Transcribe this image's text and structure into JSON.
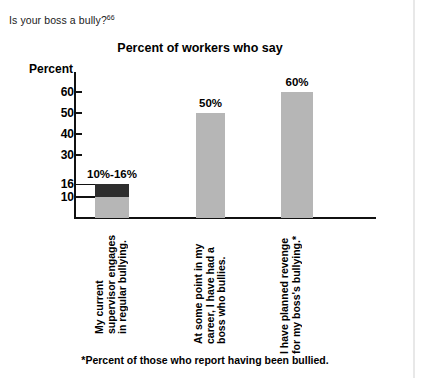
{
  "page": {
    "question_text": "Is your boss a bully?",
    "question_footnote_marker": "66",
    "footnote": "*Percent of those who report having been bullied."
  },
  "chart_data": {
    "type": "bar",
    "title": "Percent of workers who say",
    "xlabel": "",
    "ylabel": "Percent",
    "ylim": [
      0,
      66
    ],
    "grid": false,
    "legend": "none",
    "ytick_values": [
      60,
      50,
      40,
      30,
      16,
      10
    ],
    "ytick_labels": [
      "60",
      "50",
      "40",
      "30",
      "16",
      "10"
    ],
    "categories": [
      "My current supervisor engages in regular bullying.",
      "At some point in my career, I have had a boss who bullies.",
      "I have planned revenge for my boss's bullying.*"
    ],
    "values": [
      16,
      50,
      60
    ],
    "value_labels": [
      "10%-16%",
      "50%",
      "60%"
    ],
    "bar_segments": [
      {
        "low": 10,
        "high": 16,
        "color": "#2e2e2e",
        "base_color": "#b6b6b6"
      },
      {
        "low": 0,
        "high": 50,
        "color": "#b6b6b6",
        "base_color": "#b6b6b6"
      },
      {
        "low": 0,
        "high": 60,
        "color": "#b6b6b6",
        "base_color": "#b6b6b6"
      }
    ],
    "colors": {
      "bar_fill": "#b6b6b6",
      "bar_highlight": "#2e2e2e",
      "axis": "#111111",
      "text": "#000000"
    }
  }
}
